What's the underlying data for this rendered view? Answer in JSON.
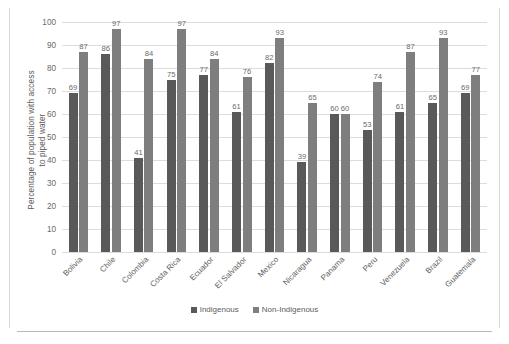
{
  "chart_data": {
    "type": "bar",
    "title": "",
    "xlabel": "",
    "ylabel": "Percentage of population with access to piped water",
    "ylabel_line1": "Percentage of population with access",
    "ylabel_line2": "to piped water",
    "ylim": [
      0,
      100
    ],
    "ytick_step": 10,
    "yticks": [
      "100",
      "90",
      "80",
      "70",
      "60",
      "50",
      "40",
      "30",
      "20",
      "10",
      "0"
    ],
    "grid": true,
    "legend_position": "bottom-center",
    "categories": [
      "Bolivia",
      "Chile",
      "Colombia",
      "Costa Rica",
      "Ecuador",
      "El Salvador",
      "Mexico",
      "Nicaragua",
      "Panama",
      "Peru",
      "Venezuela",
      "Brazil",
      "Guatemala"
    ],
    "series": [
      {
        "name": "Indigenous",
        "color": "#595959",
        "values": [
          69,
          86,
          41,
          75,
          77,
          61,
          82,
          39,
          60,
          53,
          61,
          65,
          69
        ]
      },
      {
        "name": "Non-Indigenous",
        "color": "#7e7e7e",
        "values": [
          87,
          97,
          84,
          97,
          84,
          76,
          93,
          65,
          60,
          74,
          87,
          93,
          77
        ]
      }
    ]
  },
  "legend": {
    "items": [
      {
        "label": "Indigenous"
      },
      {
        "label": "Non-Indigenous"
      }
    ]
  },
  "colors": {
    "indigenous": "#595959",
    "non_indigenous": "#7e7e7e",
    "gridline": "#dcdcdc",
    "text": "#5d5d5d",
    "frame": "#d8d8d8"
  }
}
